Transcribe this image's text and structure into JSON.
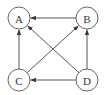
{
  "diagram": {
    "type": "directed-graph",
    "nodes": [
      {
        "id": "A",
        "label": "A",
        "x": 19,
        "y": 18
      },
      {
        "id": "B",
        "label": "B",
        "x": 87,
        "y": 18
      },
      {
        "id": "C",
        "label": "C",
        "x": 19,
        "y": 80
      },
      {
        "id": "D",
        "label": "D",
        "x": 87,
        "y": 80
      }
    ],
    "edges": [
      {
        "from": "B",
        "to": "A"
      },
      {
        "from": "C",
        "to": "A"
      },
      {
        "from": "D",
        "to": "A"
      },
      {
        "from": "C",
        "to": "B"
      },
      {
        "from": "D",
        "to": "B"
      },
      {
        "from": "D",
        "to": "C"
      }
    ],
    "colors": {
      "stroke": "#444444",
      "text": "#333333",
      "background": "#ffffff"
    }
  }
}
